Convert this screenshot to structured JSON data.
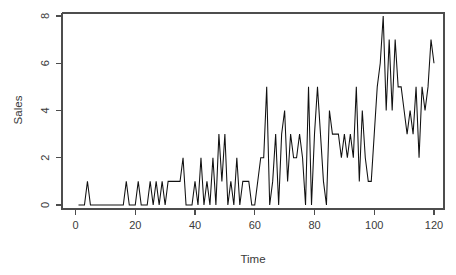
{
  "chart_data": {
    "type": "line",
    "title": "",
    "xlabel": "Time",
    "ylabel": "Sales",
    "xlim": [
      1,
      120
    ],
    "ylim": [
      0,
      8
    ],
    "grid": false,
    "legend": false,
    "x_ticks": [
      0,
      20,
      40,
      60,
      80,
      100,
      120
    ],
    "y_ticks": [
      0,
      2,
      4,
      6,
      8
    ],
    "x_tick_labels": [
      "0",
      "20",
      "40",
      "60",
      "80",
      "100",
      "120"
    ],
    "y_tick_labels": [
      "0",
      "2",
      "4",
      "6",
      "8"
    ],
    "series": [
      {
        "name": "Sales",
        "color": "#111111",
        "x": [
          1,
          2,
          3,
          4,
          5,
          6,
          7,
          8,
          9,
          10,
          11,
          12,
          13,
          14,
          15,
          16,
          17,
          18,
          19,
          20,
          21,
          22,
          23,
          24,
          25,
          26,
          27,
          28,
          29,
          30,
          31,
          32,
          33,
          34,
          35,
          36,
          37,
          38,
          39,
          40,
          41,
          42,
          43,
          44,
          45,
          46,
          47,
          48,
          49,
          50,
          51,
          52,
          53,
          54,
          55,
          56,
          57,
          58,
          59,
          60,
          61,
          62,
          63,
          64,
          65,
          66,
          67,
          68,
          69,
          70,
          71,
          72,
          73,
          74,
          75,
          76,
          77,
          78,
          79,
          80,
          81,
          82,
          83,
          84,
          85,
          86,
          87,
          88,
          89,
          90,
          91,
          92,
          93,
          94,
          95,
          96,
          97,
          98,
          99,
          100,
          101,
          102,
          103,
          104,
          105,
          106,
          107,
          108,
          109,
          110,
          111,
          112,
          113,
          114,
          115,
          116,
          117,
          118,
          119,
          120
        ],
        "values": [
          0,
          0,
          0,
          1,
          0,
          0,
          0,
          0,
          0,
          0,
          0,
          0,
          0,
          0,
          0,
          0,
          1,
          0,
          0,
          0,
          1,
          0,
          0,
          0,
          1,
          0,
          1,
          0,
          1,
          0,
          1,
          1,
          1,
          1,
          1,
          2,
          0,
          0,
          0,
          1,
          0,
          2,
          0,
          1,
          0,
          2,
          0,
          3,
          1,
          3,
          0,
          1,
          0,
          2,
          0,
          1,
          1,
          1,
          0,
          0,
          1,
          2,
          2,
          5,
          0,
          1,
          3,
          0,
          3,
          4,
          1,
          3,
          2,
          2,
          3,
          2,
          0,
          5,
          0,
          3,
          5,
          3,
          1,
          0,
          4,
          3,
          3,
          3,
          2,
          3,
          2,
          3,
          2,
          5,
          1,
          4,
          2,
          1,
          1,
          3,
          5,
          6,
          8,
          4,
          7,
          4,
          7,
          5,
          5,
          4,
          3,
          4,
          3,
          5,
          2,
          5,
          4,
          5,
          7,
          6
        ]
      }
    ]
  },
  "axes": {
    "y_label": "Sales",
    "x_label": "Time"
  }
}
